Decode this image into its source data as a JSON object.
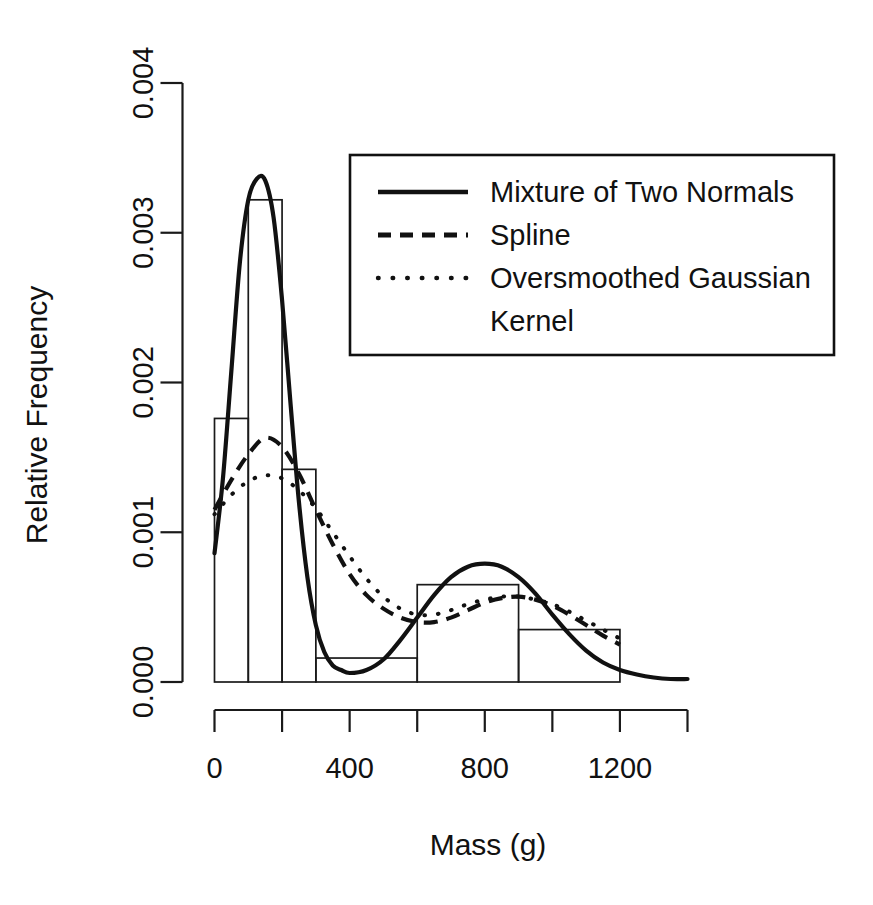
{
  "chart_data": {
    "type": "bar",
    "title": "",
    "xlabel": "Mass (g)",
    "ylabel": "Relative Frequency",
    "xlim": [
      0,
      1400
    ],
    "ylim": [
      0,
      0.004
    ],
    "grid": false,
    "legend_position": "top-right",
    "x_ticks": [
      0,
      200,
      400,
      600,
      800,
      1000,
      1200,
      1400
    ],
    "x_tick_labels": [
      "0",
      "",
      "400",
      "",
      "800",
      "",
      "1200",
      ""
    ],
    "y_ticks": [
      0.0,
      0.001,
      0.002,
      0.003,
      0.004
    ],
    "y_tick_labels": [
      "0.000",
      "0.001",
      "0.002",
      "0.003",
      "0.004"
    ],
    "histogram": {
      "name": "Relative frequency histogram",
      "bin_edges": [
        0,
        100,
        200,
        300,
        600,
        900,
        1200
      ],
      "bin_heights": [
        0.00176,
        0.00322,
        0.00142,
        0.00016,
        0.00065,
        0.00035
      ]
    },
    "series": [
      {
        "name": "Mixture of Two Normals",
        "style": "solid",
        "x": [
          0,
          25,
          50,
          75,
          100,
          125,
          150,
          175,
          200,
          225,
          250,
          275,
          300,
          325,
          350,
          375,
          400,
          450,
          500,
          550,
          600,
          650,
          700,
          750,
          800,
          850,
          900,
          950,
          1000,
          1050,
          1100,
          1150,
          1200,
          1250,
          1300,
          1350,
          1400
        ],
        "y": [
          0.00086,
          0.00136,
          0.00208,
          0.0028,
          0.00322,
          0.00336,
          0.00335,
          0.0031,
          0.00255,
          0.00186,
          0.0012,
          0.0007,
          0.00038,
          0.0002,
          0.00011,
          8e-05,
          6e-05,
          8e-05,
          0.00015,
          0.00028,
          0.00043,
          0.00058,
          0.0007,
          0.00077,
          0.00079,
          0.00077,
          0.0007,
          0.00059,
          0.00045,
          0.00032,
          0.00021,
          0.00013,
          8e-05,
          5e-05,
          3e-05,
          2e-05,
          2e-05
        ]
      },
      {
        "name": "Spline",
        "style": "dashed",
        "x": [
          0,
          50,
          100,
          150,
          200,
          250,
          300,
          350,
          400,
          450,
          500,
          550,
          600,
          650,
          700,
          750,
          800,
          850,
          900,
          950,
          1000,
          1050,
          1100,
          1150,
          1200
        ],
        "y": [
          0.00115,
          0.00135,
          0.00152,
          0.00163,
          0.00157,
          0.00139,
          0.00115,
          0.00092,
          0.00072,
          0.00058,
          0.00049,
          0.00043,
          0.0004,
          0.0004,
          0.00043,
          0.00048,
          0.00053,
          0.00056,
          0.00057,
          0.00055,
          0.00051,
          0.00045,
          0.00038,
          0.00031,
          0.00025
        ]
      },
      {
        "name": "Oversmoothed Gaussian Kernel",
        "style": "dotted",
        "x": [
          0,
          50,
          100,
          150,
          200,
          250,
          300,
          350,
          400,
          450,
          500,
          550,
          600,
          650,
          700,
          750,
          800,
          850,
          900,
          950,
          1000,
          1050,
          1100,
          1150,
          1200
        ],
        "y": [
          0.00112,
          0.00125,
          0.00134,
          0.00138,
          0.00136,
          0.00128,
          0.00116,
          0.001,
          0.00084,
          0.00069,
          0.00057,
          0.00049,
          0.00045,
          0.00045,
          0.00048,
          0.00052,
          0.00055,
          0.00057,
          0.00057,
          0.00055,
          0.00052,
          0.00047,
          0.00041,
          0.00035,
          0.00029
        ]
      }
    ],
    "legend": [
      {
        "label": "Mixture of Two Normals",
        "style": "solid"
      },
      {
        "label": "Spline",
        "style": "dashed"
      },
      {
        "label": "Oversmoothed Gaussian",
        "style": "dotted"
      },
      {
        "label": "Kernel",
        "style": "none"
      }
    ],
    "colors": {
      "ink": "#111111",
      "background": "#ffffff"
    }
  }
}
